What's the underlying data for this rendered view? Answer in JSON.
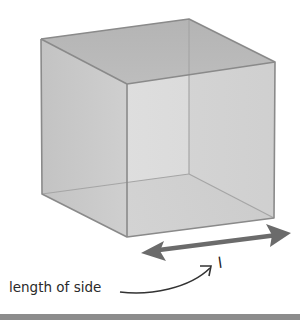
{
  "diagram": {
    "labels": {
      "side_symbol": "l",
      "side_caption": "length of side"
    },
    "colors": {
      "edge": "#8a8a8a",
      "top_face": "#b9b9b9",
      "left_face": "#cacaca",
      "front_face": "#d6d6d6",
      "bottom_face": "#b3b3b3",
      "arrow": "#6b6b6b",
      "pointer_arrow": "#333333",
      "footer_bar": "#8c8c8c"
    },
    "vertices": {
      "back_top_left": [
        41,
        39
      ],
      "back_top_right": [
        189,
        19
      ],
      "front_top_right": [
        275,
        62
      ],
      "front_top_left": [
        127,
        84
      ],
      "back_bottom_left": [
        42,
        194
      ],
      "back_bottom_right": [
        189,
        174
      ],
      "front_bottom_right": [
        274,
        218
      ],
      "front_bottom_left": [
        127,
        237
      ]
    }
  }
}
